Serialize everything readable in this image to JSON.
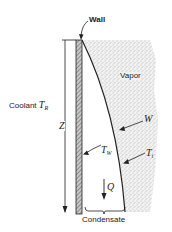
{
  "diagram": {
    "labels": {
      "wall": "Wall",
      "vapor": "Vapor",
      "coolant": "Coolant",
      "coolant_symbol": "T",
      "coolant_sub": "R",
      "height_symbol": "Z",
      "film_edge": "W",
      "wall_temp_symbol": "T",
      "wall_temp_sub": "W",
      "interface_temp_symbol": "T",
      "interface_temp_sub": "i",
      "heat_flow": "Q",
      "condensate": "Condensate"
    },
    "colors": {
      "line": "#222222",
      "wall_fill": "#9a9a9a",
      "vapor_dots": "#8a8a8a"
    }
  }
}
